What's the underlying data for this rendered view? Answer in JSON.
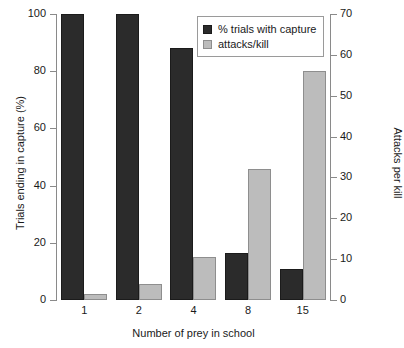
{
  "chart_data": {
    "type": "bar",
    "title": "",
    "categories": [
      "1",
      "2",
      "4",
      "8",
      "15"
    ],
    "xlabel": "Number of prey in school",
    "ylabel": "Trials ending in capture (%)",
    "ylabel_right": "Attacks per kill",
    "ylim": [
      0,
      100
    ],
    "ylim_right": [
      0,
      70
    ],
    "yticks": [
      0,
      20,
      40,
      60,
      80,
      100
    ],
    "yticks_right": [
      0,
      10,
      20,
      30,
      40,
      50,
      60,
      70
    ],
    "grid": false,
    "legend_position": "top-right",
    "series": [
      {
        "name": "% trials with capture",
        "axis": "left",
        "color": "#2b2b2b",
        "values": [
          100,
          100,
          88,
          16.5,
          11
        ]
      },
      {
        "name": "attacks/kill",
        "axis": "right",
        "color": "#bcbcbc",
        "values": [
          1.5,
          4,
          10.5,
          32,
          56
        ]
      }
    ]
  },
  "legend": {
    "items": [
      {
        "label": "% trials with capture",
        "swatch": "dark"
      },
      {
        "label": "attacks/kill",
        "swatch": "light"
      }
    ]
  }
}
